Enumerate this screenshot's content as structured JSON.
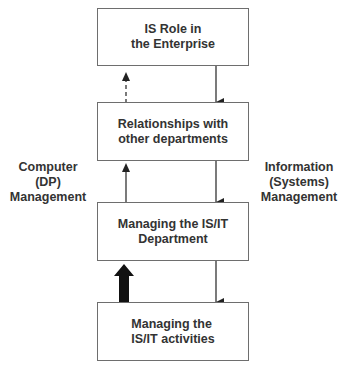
{
  "boxes": [
    {
      "id": "is-role",
      "line1": "IS Role in",
      "line2": "the Enterprise"
    },
    {
      "id": "relationships",
      "line1": "Relationships with",
      "line2": "other departments"
    },
    {
      "id": "managing-department",
      "line1": "Managing the IS/IT",
      "line2": "Department"
    },
    {
      "id": "managing-activities",
      "line1": "Managing the",
      "line2": "IS/IT activities"
    }
  ],
  "side_labels": {
    "left": {
      "line1": "Computer",
      "line2": "(DP)",
      "line3": "Management"
    },
    "right": {
      "line1": "Information",
      "line2": "(Systems)",
      "line3": "Management"
    }
  },
  "colors": {
    "border": "#6e6e6e",
    "arrow": "#222222",
    "text": "#333333"
  }
}
